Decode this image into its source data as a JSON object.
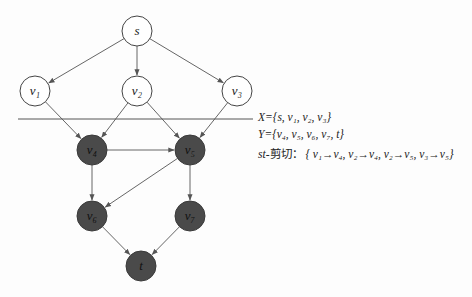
{
  "diagram": {
    "colors": {
      "edge": "#555555",
      "node_light_fill": "#ffffff",
      "node_light_stroke": "#444444",
      "node_dark_fill": "#4a4a4a",
      "node_dark_stroke": "#3a3a3a",
      "cut_line": "#555555"
    },
    "nodes": [
      {
        "id": "s",
        "label": "s",
        "x": 137,
        "y": 31,
        "set": "X"
      },
      {
        "id": "v1",
        "label": "v₁",
        "x": 35,
        "y": 91,
        "set": "X"
      },
      {
        "id": "v2",
        "label": "v₂",
        "x": 137,
        "y": 91,
        "set": "X"
      },
      {
        "id": "v3",
        "label": "v₃",
        "x": 237,
        "y": 91,
        "set": "X"
      },
      {
        "id": "v4",
        "label": "v₄",
        "x": 92,
        "y": 150,
        "set": "Y"
      },
      {
        "id": "v5",
        "label": "v₅",
        "x": 190,
        "y": 150,
        "set": "Y"
      },
      {
        "id": "v6",
        "label": "v₆",
        "x": 92,
        "y": 216,
        "set": "Y"
      },
      {
        "id": "v7",
        "label": "v₇",
        "x": 190,
        "y": 216,
        "set": "Y"
      },
      {
        "id": "t",
        "label": "t",
        "x": 141,
        "y": 266,
        "set": "Y"
      }
    ],
    "edges": [
      [
        "s",
        "v1"
      ],
      [
        "s",
        "v2"
      ],
      [
        "s",
        "v3"
      ],
      [
        "v1",
        "v4"
      ],
      [
        "v2",
        "v4"
      ],
      [
        "v2",
        "v5"
      ],
      [
        "v3",
        "v5"
      ],
      [
        "v4",
        "v5"
      ],
      [
        "v4",
        "v6"
      ],
      [
        "v5",
        "v6"
      ],
      [
        "v5",
        "v7"
      ],
      [
        "v6",
        "t"
      ],
      [
        "v7",
        "t"
      ]
    ],
    "cut_line": {
      "x1": 18,
      "y1": 119,
      "x2": 253,
      "y2": 119
    }
  },
  "legend": {
    "x_set": "X={s, v₁, v₂, v₃}",
    "y_set": "Y={v₄, v₅, v₆, v₇, t}",
    "cut_prefix": "st-",
    "cut_label_cn": "剪切：",
    "cut_edges": "{ v₁→v₄,  v₂→v₄, v₂→v₅, v₃→v₅}"
  }
}
